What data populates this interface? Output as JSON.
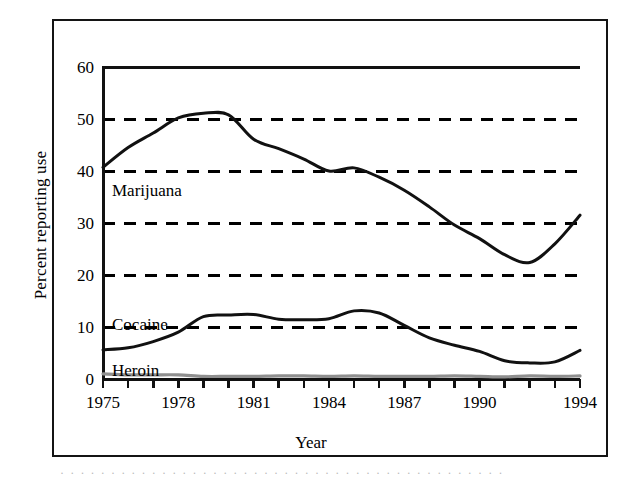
{
  "figure": {
    "background_color": "#ffffff",
    "frame_color": "#141414",
    "line_color": "#111111",
    "heroin_color": "#8f8f8f",
    "gridline_color": "#000000"
  },
  "axes": {
    "xlabel": "Year",
    "ylabel": "Percent reporting use",
    "y_ticks": [
      "0",
      "10",
      "20",
      "30",
      "40",
      "50",
      "60"
    ],
    "x_ticks": [
      "1975",
      "1978",
      "1981",
      "1984",
      "1987",
      "1990",
      "1994"
    ]
  },
  "series_labels": {
    "marijuana": "Marijuana",
    "cocaine": "Cocaine",
    "heroin": "Heroin"
  },
  "caption": {
    "partial_text": "· · · · · · · · · · · · · · · · · · · · · · · · · · · · · · · · · · · · · · · · · · · ·"
  },
  "chart_data": {
    "type": "line",
    "title": "",
    "xlabel": "Year",
    "ylabel": "Percent reporting use",
    "xlim": [
      1975,
      1994
    ],
    "ylim": [
      0,
      60
    ],
    "grid": "horizontal-dashed-at-10-20-30-40-50",
    "legend": "inline-labels",
    "x": [
      1975,
      1976,
      1977,
      1978,
      1979,
      1980,
      1981,
      1982,
      1983,
      1984,
      1985,
      1986,
      1987,
      1988,
      1989,
      1990,
      1991,
      1992,
      1993,
      1994
    ],
    "series": [
      {
        "name": "Marijuana",
        "values": [
          40.7,
          44.5,
          47.3,
          50.2,
          51.1,
          50.8,
          46.1,
          44.3,
          42.3,
          40.0,
          40.6,
          38.8,
          36.3,
          33.1,
          29.6,
          27.0,
          23.9,
          22.4,
          26.0,
          31.5
        ]
      },
      {
        "name": "Cocaine",
        "values": [
          5.6,
          6.0,
          7.2,
          9.0,
          12.0,
          12.3,
          12.4,
          11.5,
          11.4,
          11.6,
          13.1,
          12.7,
          10.3,
          7.9,
          6.5,
          5.3,
          3.5,
          3.1,
          3.3,
          5.5
        ]
      },
      {
        "name": "Heroin",
        "values": [
          1.0,
          0.8,
          0.8,
          0.8,
          0.5,
          0.5,
          0.5,
          0.6,
          0.6,
          0.5,
          0.6,
          0.5,
          0.5,
          0.5,
          0.6,
          0.5,
          0.4,
          0.6,
          0.5,
          0.6
        ]
      }
    ]
  }
}
